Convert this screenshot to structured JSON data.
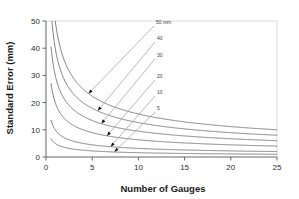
{
  "chart_data": {
    "type": "line",
    "title": "",
    "xlabel": "Number of Gauges",
    "ylabel": "Standard Error (mm)",
    "xlim": [
      0,
      25
    ],
    "ylim": [
      0,
      50
    ],
    "xticks": [
      0,
      5,
      10,
      15,
      20,
      25
    ],
    "yticks": [
      0,
      10,
      20,
      30,
      40,
      50
    ],
    "xtick_labels": [
      "0",
      "5",
      "10",
      "15",
      "20",
      "25"
    ],
    "ytick_labels": [
      "0",
      "10",
      "20",
      "30",
      "40",
      "50"
    ],
    "grid": false,
    "legend_position": "inline-annotations",
    "relationship": "standard_error = coefficient / sqrt(number_of_gauges)",
    "series": [
      {
        "name": "50 mm",
        "label": "50 mm",
        "coefficient": 50,
        "x": [
          1,
          2,
          3,
          4,
          5,
          6,
          7,
          8,
          9,
          10,
          11,
          12,
          13,
          14,
          15,
          16,
          17,
          18,
          19,
          20,
          21,
          22,
          23,
          24,
          25
        ],
        "values": [
          50,
          35.4,
          28.9,
          25,
          22.4,
          20.4,
          18.9,
          17.7,
          16.7,
          15.8,
          15.1,
          14.4,
          13.9,
          13.4,
          12.9,
          12.5,
          12.1,
          11.8,
          11.5,
          11.2,
          10.9,
          10.7,
          10.4,
          10.2,
          10
        ]
      },
      {
        "name": "40",
        "label": "40",
        "coefficient": 40,
        "x": [
          1,
          2,
          3,
          4,
          5,
          6,
          7,
          8,
          9,
          10,
          11,
          12,
          13,
          14,
          15,
          16,
          17,
          18,
          19,
          20,
          21,
          22,
          23,
          24,
          25
        ],
        "values": [
          40,
          28.3,
          23.1,
          20,
          17.9,
          16.3,
          15.1,
          14.1,
          13.3,
          12.6,
          12.1,
          11.5,
          11.1,
          10.7,
          10.3,
          10,
          9.7,
          9.4,
          9.2,
          8.9,
          8.7,
          8.5,
          8.3,
          8.2,
          8
        ]
      },
      {
        "name": "30",
        "label": "30",
        "coefficient": 30,
        "x": [
          1,
          2,
          3,
          4,
          5,
          6,
          7,
          8,
          9,
          10,
          11,
          12,
          13,
          14,
          15,
          16,
          17,
          18,
          19,
          20,
          21,
          22,
          23,
          24,
          25
        ],
        "values": [
          30,
          21.2,
          17.3,
          15,
          13.4,
          12.2,
          11.3,
          10.6,
          10,
          9.5,
          9,
          8.7,
          8.3,
          8,
          7.7,
          7.5,
          7.3,
          7.1,
          6.9,
          6.7,
          6.5,
          6.4,
          6.3,
          6.1,
          6
        ]
      },
      {
        "name": "20",
        "label": "20",
        "coefficient": 20,
        "x": [
          1,
          2,
          3,
          4,
          5,
          6,
          7,
          8,
          9,
          10,
          11,
          12,
          13,
          14,
          15,
          16,
          17,
          18,
          19,
          20,
          21,
          22,
          23,
          24,
          25
        ],
        "values": [
          20,
          14.1,
          11.5,
          10,
          8.9,
          8.2,
          7.6,
          7.1,
          6.7,
          6.3,
          6,
          5.8,
          5.5,
          5.3,
          5.2,
          5,
          4.9,
          4.7,
          4.6,
          4.5,
          4.4,
          4.3,
          4.2,
          4.1,
          4
        ]
      },
      {
        "name": "10",
        "label": "10",
        "coefficient": 10,
        "x": [
          1,
          2,
          3,
          4,
          5,
          6,
          7,
          8,
          9,
          10,
          11,
          12,
          13,
          14,
          15,
          16,
          17,
          18,
          19,
          20,
          21,
          22,
          23,
          24,
          25
        ],
        "values": [
          10,
          7.1,
          5.8,
          5,
          4.5,
          4.1,
          3.8,
          3.5,
          3.3,
          3.2,
          3,
          2.9,
          2.8,
          2.7,
          2.6,
          2.5,
          2.4,
          2.4,
          2.3,
          2.2,
          2.2,
          2.1,
          2.1,
          2,
          2
        ]
      },
      {
        "name": "5",
        "label": "5",
        "coefficient": 5,
        "x": [
          1,
          2,
          3,
          4,
          5,
          6,
          7,
          8,
          9,
          10,
          11,
          12,
          13,
          14,
          15,
          16,
          17,
          18,
          19,
          20,
          21,
          22,
          23,
          24,
          25
        ],
        "values": [
          5,
          3.5,
          2.9,
          2.5,
          2.2,
          2,
          1.9,
          1.8,
          1.7,
          1.6,
          1.5,
          1.4,
          1.4,
          1.3,
          1.3,
          1.3,
          1.2,
          1.2,
          1.1,
          1.1,
          1.1,
          1.1,
          1,
          1,
          1
        ]
      }
    ],
    "annotations": [
      {
        "label": "50 mm",
        "target_x": 4.6,
        "target_y": 23.3
      },
      {
        "label": "40",
        "target_x": 5.6,
        "target_y": 17.0
      },
      {
        "label": "30",
        "target_x": 6.0,
        "target_y": 12.3
      },
      {
        "label": "20",
        "target_x": 6.6,
        "target_y": 7.8
      },
      {
        "label": "10",
        "target_x": 7.0,
        "target_y": 3.8
      },
      {
        "label": "5",
        "target_x": 7.4,
        "target_y": 1.9
      }
    ],
    "colors": {
      "curve": "#6b6b6b",
      "axis": "#555555",
      "text": "#1a1a1a",
      "leader": "#9a9a9a",
      "background": "#ffffff"
    }
  }
}
